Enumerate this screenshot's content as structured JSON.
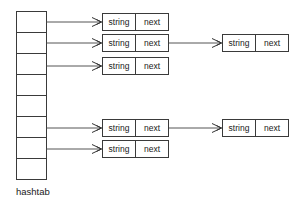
{
  "diagram": {
    "caption": "hashtab",
    "field_labels": {
      "string": "string",
      "next": "next"
    },
    "colors": {
      "box_stroke": "#3a3a3a",
      "box_fill": "#ffffff",
      "connector": "#555555",
      "text": "#1a1a1a",
      "background": "#ffffff"
    },
    "table": {
      "name": "hashtab",
      "cell_count": 8,
      "cells": [
        {
          "index": 0,
          "has_chain": true
        },
        {
          "index": 1,
          "has_chain": true
        },
        {
          "index": 2,
          "has_chain": true
        },
        {
          "index": 3,
          "has_chain": false
        },
        {
          "index": 4,
          "has_chain": false
        },
        {
          "index": 5,
          "has_chain": true
        },
        {
          "index": 6,
          "has_chain": true
        },
        {
          "index": 7,
          "has_chain": false
        }
      ]
    },
    "chains": [
      {
        "bucket": 0,
        "nodes": [
          {
            "string": "string",
            "next": "next"
          }
        ]
      },
      {
        "bucket": 1,
        "nodes": [
          {
            "string": "string",
            "next": "next"
          },
          {
            "string": "string",
            "next": "next"
          }
        ]
      },
      {
        "bucket": 2,
        "nodes": [
          {
            "string": "string",
            "next": "next"
          }
        ]
      },
      {
        "bucket": 5,
        "nodes": [
          {
            "string": "string",
            "next": "next"
          },
          {
            "string": "string",
            "next": "next"
          }
        ]
      },
      {
        "bucket": 6,
        "nodes": [
          {
            "string": "string",
            "next": "next"
          }
        ]
      }
    ],
    "nodes_column1": [
      {
        "id": "n-0-0",
        "string": "string",
        "next": "next"
      },
      {
        "id": "n-1-0",
        "string": "string",
        "next": "next"
      },
      {
        "id": "n-2-0",
        "string": "string",
        "next": "next"
      },
      {
        "id": "n-5-0",
        "string": "string",
        "next": "next"
      },
      {
        "id": "n-6-0",
        "string": "string",
        "next": "next"
      }
    ],
    "nodes_column2": [
      {
        "id": "n-1-1",
        "string": "string",
        "next": "next"
      },
      {
        "id": "n-5-1",
        "string": "string",
        "next": "next"
      }
    ]
  }
}
